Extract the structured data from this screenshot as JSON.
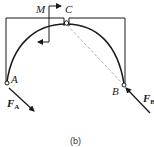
{
  "figure": {
    "caption": "(b)",
    "labels": {
      "moment": "M",
      "hinge_top": "C",
      "support_left": "A",
      "support_right": "B",
      "force_left_main": "F",
      "force_left_sub": "A",
      "force_right_main": "F",
      "force_right_sub": "B"
    },
    "colors": {
      "stroke": "#1a1a1a",
      "dashed": "#9a9a9a"
    }
  }
}
